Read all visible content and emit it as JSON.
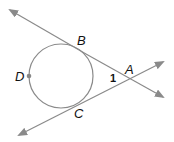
{
  "diagram": {
    "type": "circle-with-two-tangents",
    "colors": {
      "line": "#8a8a8a",
      "circle": "#8a8a8a",
      "point": "#888888",
      "text": "#111111"
    },
    "circle": {
      "cx": 61,
      "cy": 76,
      "r": 32
    },
    "points": {
      "A": {
        "label": "A",
        "x": 129,
        "y": 79
      },
      "B": {
        "label": "B",
        "x": 76,
        "y": 48
      },
      "C": {
        "label": "C",
        "x": 72,
        "y": 106
      },
      "D": {
        "label": "D",
        "x": 29,
        "y": 76
      }
    },
    "angle_label": "1",
    "lines": [
      {
        "name": "tangent-BA",
        "x1": 10,
        "y1": 10,
        "x2": 163,
        "y2": 97
      },
      {
        "name": "tangent-CA",
        "x1": 19,
        "y1": 135,
        "x2": 163,
        "y2": 62
      }
    ]
  }
}
